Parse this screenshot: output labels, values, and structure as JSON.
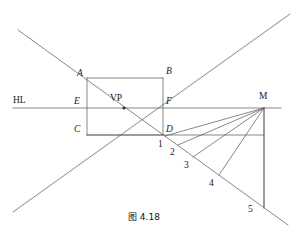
{
  "figure": {
    "caption": "图 4.18",
    "caption_pos": {
      "x": 128,
      "y": 210
    },
    "stroke_color": "#555555",
    "stroke_width": 0.7,
    "background": "#ffffff"
  },
  "labels": {
    "hl": {
      "text": "HL",
      "x": 13,
      "y": 96,
      "style": "upright"
    },
    "vp": {
      "text": "VP",
      "x": 110,
      "y": 94,
      "style": "upright"
    },
    "m": {
      "text": "M",
      "x": 259,
      "y": 92,
      "style": "upright"
    },
    "a": {
      "text": "A",
      "x": 77,
      "y": 69,
      "style": "italic"
    },
    "b": {
      "text": "B",
      "x": 166,
      "y": 67,
      "style": "italic"
    },
    "e": {
      "text": "E",
      "x": 74,
      "y": 97,
      "style": "italic"
    },
    "f": {
      "text": "F",
      "x": 166,
      "y": 97,
      "style": "italic"
    },
    "c": {
      "text": "C",
      "x": 74,
      "y": 125,
      "style": "italic"
    },
    "d": {
      "text": "D",
      "x": 166,
      "y": 125,
      "style": "italic"
    },
    "n1": {
      "text": "1",
      "x": 158,
      "y": 140,
      "style": "upright"
    },
    "n2": {
      "text": "2",
      "x": 170,
      "y": 148,
      "style": "upright"
    },
    "n3": {
      "text": "3",
      "x": 184,
      "y": 161,
      "style": "upright"
    },
    "n4": {
      "text": "4",
      "x": 209,
      "y": 179,
      "style": "upright"
    },
    "n5": {
      "text": "5",
      "x": 248,
      "y": 205,
      "style": "upright"
    }
  },
  "geometry": {
    "points": {
      "A": {
        "x": 87,
        "y": 78
      },
      "B": {
        "x": 163,
        "y": 78
      },
      "E": {
        "x": 87,
        "y": 108
      },
      "VP": {
        "x": 124,
        "y": 108
      },
      "F": {
        "x": 163,
        "y": 108
      },
      "M": {
        "x": 264,
        "y": 108
      },
      "C": {
        "x": 87,
        "y": 135
      },
      "D": {
        "x": 163,
        "y": 135
      },
      "P1": {
        "x": 166,
        "y": 137
      },
      "P2": {
        "x": 179,
        "y": 146
      },
      "P3": {
        "x": 194,
        "y": 157
      },
      "P4": {
        "x": 219,
        "y": 175
      },
      "P5": {
        "x": 264,
        "y": 208
      },
      "GR": {
        "x": 264,
        "y": 135
      }
    },
    "horizon_line": {
      "x1": 13,
      "y1": 108,
      "x2": 281,
      "y2": 108
    },
    "diagonal_down": {
      "x1": 18,
      "y1": 30,
      "x2": 288,
      "y2": 225
    },
    "diagonal_up": {
      "x1": 13,
      "y1": 212,
      "x2": 290,
      "y2": 14
    },
    "rect_sides": [
      {
        "name": "AB",
        "x1": 87,
        "y1": 78,
        "x2": 163,
        "y2": 78
      },
      {
        "name": "AC",
        "x1": 87,
        "y1": 78,
        "x2": 87,
        "y2": 135
      },
      {
        "name": "BD",
        "x1": 163,
        "y1": 78,
        "x2": 163,
        "y2": 135
      },
      {
        "name": "CD",
        "x1": 87,
        "y1": 135,
        "x2": 163,
        "y2": 135
      }
    ],
    "ground_line": {
      "x1": 87,
      "y1": 135,
      "x2": 264,
      "y2": 135
    },
    "m_vertical": {
      "x1": 264,
      "y1": 108,
      "x2": 264,
      "y2": 208
    },
    "measure_rays": [
      {
        "name": "M-1",
        "x1": 264,
        "y1": 108,
        "x2": 165,
        "y2": 136
      },
      {
        "name": "M-2",
        "x1": 264,
        "y1": 108,
        "x2": 178,
        "y2": 145
      },
      {
        "name": "M-3",
        "x1": 264,
        "y1": 108,
        "x2": 193,
        "y2": 157
      },
      {
        "name": "M-4",
        "x1": 264,
        "y1": 108,
        "x2": 219,
        "y2": 175
      },
      {
        "name": "M-5",
        "x1": 264,
        "y1": 108,
        "x2": 264,
        "y2": 208
      }
    ],
    "vp_dot": {
      "x": 124,
      "y": 108,
      "r": 1.6
    }
  }
}
